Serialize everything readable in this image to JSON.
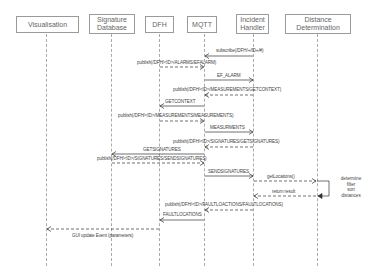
{
  "diagram": {
    "type": "sequence",
    "actors": [
      {
        "id": "vis",
        "label": "Visualisation"
      },
      {
        "id": "sigdb",
        "label": "Signature Database"
      },
      {
        "id": "dfh",
        "label": "DFH"
      },
      {
        "id": "mqtt",
        "label": "MQTT"
      },
      {
        "id": "ih",
        "label": "Incident Handler"
      },
      {
        "id": "dd",
        "label": "Distance Determination"
      }
    ],
    "messages": [
      {
        "from": "ih",
        "to": "mqtt",
        "label": "subscribe(/DFH/+/ID+/#)",
        "style": "solid"
      },
      {
        "from": "dfh",
        "to": "mqtt",
        "label": "publish(/DFH/<ID>/ALARMS/EFALARM)",
        "style": "dashed"
      },
      {
        "from": "mqtt",
        "to": "ih",
        "label": "EF_ALARM",
        "style": "solid"
      },
      {
        "from": "ih",
        "to": "mqtt",
        "label": "publish(/DFH/<ID>/MEASUREMENTS/GETCONTEXT)",
        "style": "dashed"
      },
      {
        "from": "mqtt",
        "to": "dfh",
        "label": "GETCONTEXT",
        "style": "solid"
      },
      {
        "from": "dfh",
        "to": "mqtt",
        "label": "publish(/DFH/<ID>/MEASUREMENTS/MEASUREMENTS)",
        "style": "dashed"
      },
      {
        "from": "mqtt",
        "to": "ih",
        "label": "MEASURMENTS",
        "style": "solid"
      },
      {
        "from": "ih",
        "to": "mqtt",
        "label": "publish(/DFH/<ID>/SIGNATURES/GETSIGNATURES)",
        "style": "dashed"
      },
      {
        "from": "mqtt",
        "to": "sigdb",
        "label": "GETSIGNATURES",
        "style": "solid"
      },
      {
        "from": "sigdb",
        "to": "mqtt",
        "label": "publish(/DFH/<ID>/SIGNATURES/SENDSIGNATURES)",
        "style": "dashed"
      },
      {
        "from": "mqtt",
        "to": "ih",
        "label": "SENDSIGNATURES",
        "style": "solid"
      },
      {
        "from": "ih",
        "to": "dd",
        "label": "getLocations()",
        "style": "dashed"
      },
      {
        "from": "dd",
        "to": "ih",
        "label": "return result",
        "style": "dashed"
      },
      {
        "from": "ih",
        "to": "mqtt",
        "label": "publish(/DFH/<ID>/FAULTLOACTIONS/FAULTLOCATIONS)",
        "style": "dashed"
      },
      {
        "from": "mqtt",
        "to": "dfh",
        "label": "FAULTLOCATIONS",
        "style": "solid"
      },
      {
        "from": "dfh",
        "to": "vis",
        "label": "GUI update Event (parameters)",
        "style": "dashed"
      }
    ],
    "self_note": {
      "actor": "dd",
      "lines": [
        "determine",
        "filter",
        "sort",
        "distances"
      ]
    }
  }
}
